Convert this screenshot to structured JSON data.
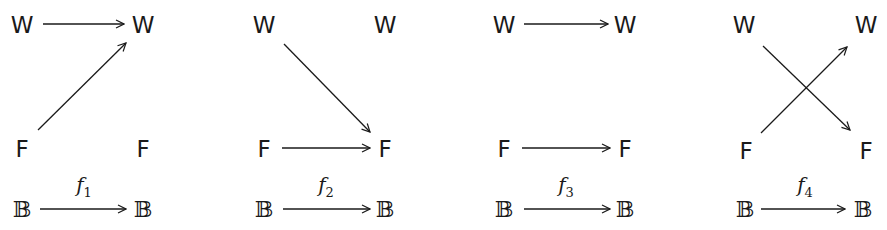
{
  "diagrams": [
    {
      "tl": "W",
      "tr": "W",
      "bl": "F",
      "br": "F",
      "base_l": "𝔹",
      "base_r": "𝔹",
      "map": "f",
      "sub": "1"
    },
    {
      "tl": "W",
      "tr": "W",
      "bl": "F",
      "br": "F",
      "base_l": "𝔹",
      "base_r": "𝔹",
      "map": "f",
      "sub": "2"
    },
    {
      "tl": "W",
      "tr": "W",
      "bl": "F",
      "br": "F",
      "base_l": "𝔹",
      "base_r": "𝔹",
      "map": "f",
      "sub": "3"
    },
    {
      "tl": "W",
      "tr": "W",
      "bl": "F",
      "br": "F",
      "base_l": "𝔹",
      "base_r": "𝔹",
      "map": "f",
      "sub": "4"
    }
  ],
  "arrows": {
    "f1": [
      "W→W",
      "F→W"
    ],
    "f2": [
      "W→F",
      "F→F"
    ],
    "f3": [
      "W→W",
      "F→F"
    ],
    "f4": [
      "W→F",
      "F→W"
    ]
  }
}
